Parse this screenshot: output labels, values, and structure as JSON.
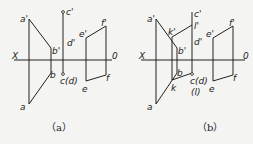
{
  "figure": {
    "panels": [
      {
        "id": "a",
        "caption": "（a）",
        "axis": {
          "left_label": "X",
          "right_label": "0"
        },
        "labels": {
          "a_prime": "a'",
          "a": "a",
          "b_prime": "b'",
          "b": "b",
          "c_prime": "c'",
          "d_prime": "d'",
          "cd": "c(d)",
          "e_prime": "e'",
          "e": "e",
          "f_prime": "f'",
          "f": "f"
        }
      },
      {
        "id": "b",
        "caption": "（b）",
        "axis": {
          "left_label": "X",
          "right_label": "0"
        },
        "labels": {
          "a_prime": "a'",
          "a": "a",
          "k_prime": "k'",
          "k": "k",
          "b_prime": "b'",
          "b": "b",
          "c_prime": "c'",
          "l_prime": "l'",
          "d_prime": "d'",
          "cd": "c(d)",
          "l": "(l)",
          "e_prime": "e'",
          "e": "e",
          "f_prime": "f'",
          "f": "f"
        }
      }
    ]
  }
}
